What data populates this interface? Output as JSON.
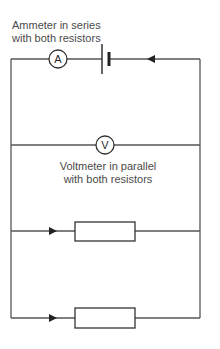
{
  "diagram": {
    "type": "circuit",
    "ammeter_label": {
      "line1": "Ammeter in series",
      "line2": "with both resistors"
    },
    "voltmeter_label": {
      "line1": "Voltmeter in parallel",
      "line2": "with both resistors"
    },
    "components": {
      "ammeter": {
        "symbol": "A"
      },
      "voltmeter": {
        "symbol": "V"
      },
      "battery": {
        "symbol": "cell"
      },
      "resistor_1": {
        "symbol": "resistor"
      },
      "resistor_2": {
        "symbol": "resistor"
      }
    },
    "colors": {
      "wire": "#555555",
      "text": "#4a4a4a",
      "background": "#ffffff"
    }
  }
}
